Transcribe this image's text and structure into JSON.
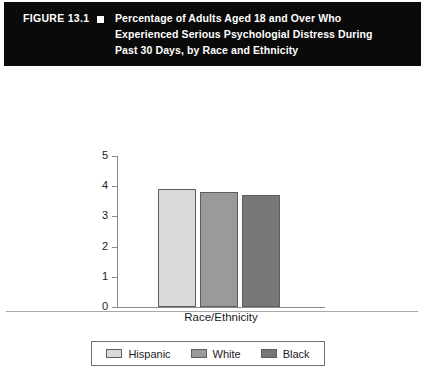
{
  "figure": {
    "number_label": "FIGURE 13.1",
    "bullet_icon": "square-bullet-icon",
    "title_line1": "Percentage of Adults Aged 18 and Over Who",
    "title_line2": "Experienced Serious Psychologial Distress During",
    "title_line3": "Past 30 Days, by Race and Ethnicity",
    "header_background": "#0a0a0a",
    "header_text_color": "#ffffff"
  },
  "chart_data": {
    "type": "bar",
    "title": "Percentage of Adults Aged 18 and Over Who Experienced Serious Psychologial Distress During Past 30 Days, by Race and Ethnicity",
    "xlabel": "Race/Ethnicity",
    "ylabel": "",
    "ylim": [
      0,
      5
    ],
    "yticks": [
      "0",
      "1",
      "2",
      "3",
      "4",
      "5"
    ],
    "grid": false,
    "legend_position": "bottom",
    "categories": [
      "Hispanic",
      "White",
      "Black"
    ],
    "values": [
      3.9,
      3.8,
      3.7
    ],
    "series": [
      {
        "name": "Hispanic",
        "value": 3.9,
        "color": "#d9d9d9"
      },
      {
        "name": "White",
        "value": 3.8,
        "color": "#9a9a9a"
      },
      {
        "name": "Black",
        "value": 3.7,
        "color": "#777777"
      }
    ]
  },
  "axes": {
    "bar_border_color": "#5e5e5e",
    "axis_line_color": "#8a8a8a"
  }
}
